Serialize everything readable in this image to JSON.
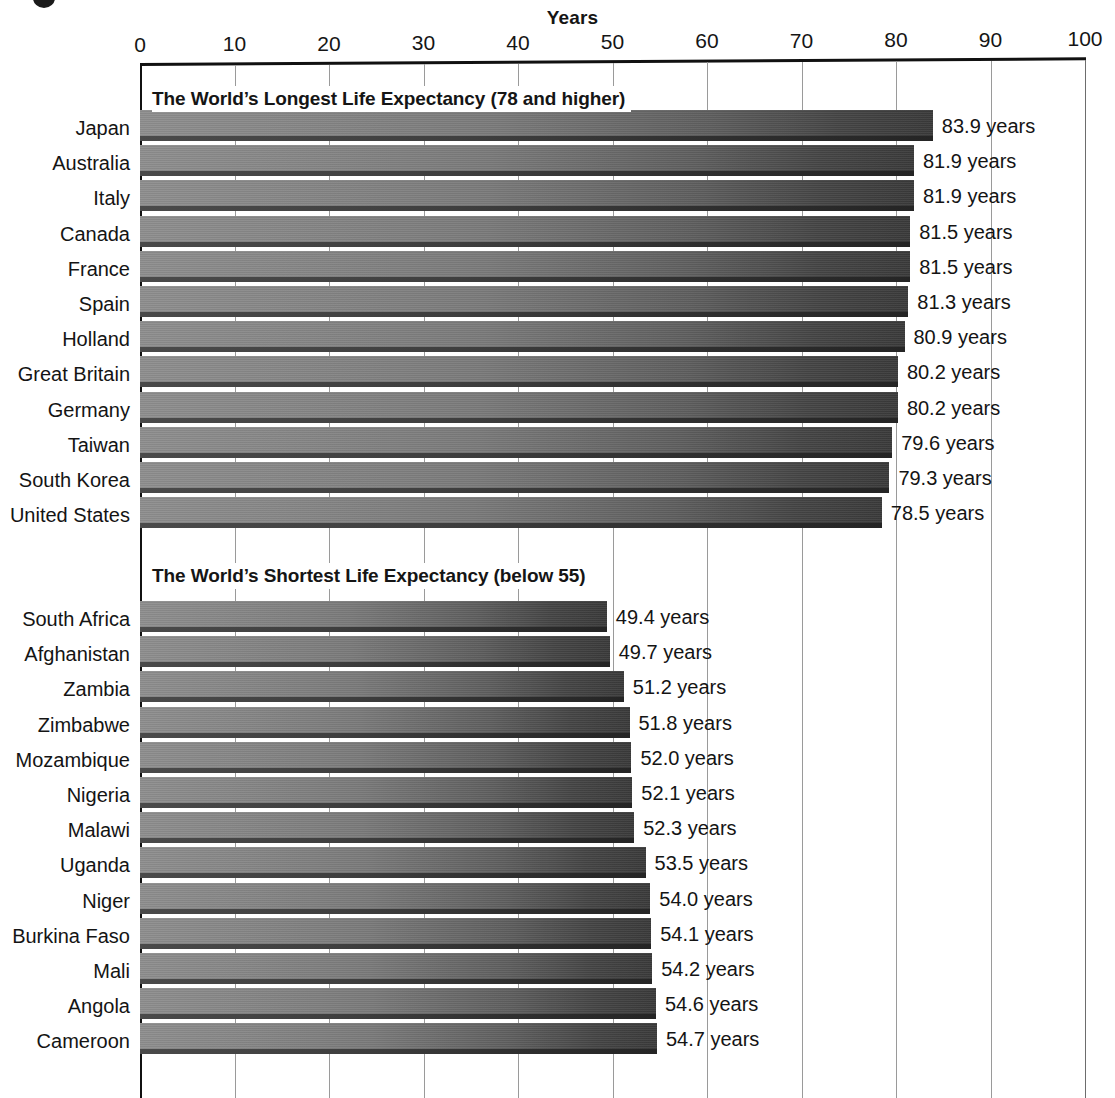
{
  "axis": {
    "title": "Years",
    "ticks": [
      0,
      10,
      20,
      30,
      40,
      50,
      60,
      70,
      80,
      90,
      100
    ],
    "min": 0,
    "max": 100,
    "unit_suffix": "years"
  },
  "sections": [
    {
      "id": "longest",
      "title": "The World’s Longest Life Expectancy (78 and higher)",
      "rows": [
        {
          "label": "Japan",
          "value": 83.9,
          "value_label": "83.9 years"
        },
        {
          "label": "Australia",
          "value": 81.9,
          "value_label": "81.9 years"
        },
        {
          "label": "Italy",
          "value": 81.9,
          "value_label": "81.9 years"
        },
        {
          "label": "Canada",
          "value": 81.5,
          "value_label": "81.5 years"
        },
        {
          "label": "France",
          "value": 81.5,
          "value_label": "81.5 years"
        },
        {
          "label": "Spain",
          "value": 81.3,
          "value_label": "81.3 years"
        },
        {
          "label": "Holland",
          "value": 80.9,
          "value_label": "80.9 years"
        },
        {
          "label": "Great Britain",
          "value": 80.2,
          "value_label": "80.2 years"
        },
        {
          "label": "Germany",
          "value": 80.2,
          "value_label": "80.2 years"
        },
        {
          "label": "Taiwan",
          "value": 79.6,
          "value_label": "79.6 years"
        },
        {
          "label": "South Korea",
          "value": 79.3,
          "value_label": "79.3 years"
        },
        {
          "label": "United States",
          "value": 78.5,
          "value_label": "78.5 years"
        }
      ]
    },
    {
      "id": "shortest",
      "title": "The World’s Shortest Life Expectancy (below 55)",
      "rows": [
        {
          "label": "South Africa",
          "value": 49.4,
          "value_label": "49.4 years"
        },
        {
          "label": "Afghanistan",
          "value": 49.7,
          "value_label": "49.7 years"
        },
        {
          "label": "Zambia",
          "value": 51.2,
          "value_label": "51.2 years"
        },
        {
          "label": "Zimbabwe",
          "value": 51.8,
          "value_label": "51.8 years"
        },
        {
          "label": "Mozambique",
          "value": 52.0,
          "value_label": "52.0 years"
        },
        {
          "label": "Nigeria",
          "value": 52.1,
          "value_label": "52.1 years"
        },
        {
          "label": "Malawi",
          "value": 52.3,
          "value_label": "52.3 years"
        },
        {
          "label": "Uganda",
          "value": 53.5,
          "value_label": "53.5 years"
        },
        {
          "label": "Niger",
          "value": 54.0,
          "value_label": "54.0 years"
        },
        {
          "label": "Burkina Faso",
          "value": 54.1,
          "value_label": "54.1 years"
        },
        {
          "label": "Mali",
          "value": 54.2,
          "value_label": "54.2 years"
        },
        {
          "label": "Angola",
          "value": 54.6,
          "value_label": "54.6 years"
        },
        {
          "label": "Cameroon",
          "value": 54.7,
          "value_label": "54.7 years"
        }
      ]
    }
  ],
  "colors": {
    "bar_light": "#8e8e8e",
    "bar_dark": "#3a3a3a",
    "bar_shadow": "#2e2e2e",
    "axis": "#111111",
    "gridline": "#9a9a9a",
    "text": "#141414",
    "background": "#ffffff"
  },
  "chart_data": {
    "type": "bar",
    "orientation": "horizontal",
    "title": "Years",
    "xlabel": "Years",
    "ylabel": "",
    "xlim": [
      0,
      100
    ],
    "xticks": [
      0,
      10,
      20,
      30,
      40,
      50,
      60,
      70,
      80,
      90,
      100
    ],
    "grid": true,
    "legend": "none",
    "groups": [
      {
        "name": "The World’s Longest Life Expectancy (78 and higher)",
        "categories": [
          "Japan",
          "Australia",
          "Italy",
          "Canada",
          "France",
          "Spain",
          "Holland",
          "Great Britain",
          "Germany",
          "Taiwan",
          "South Korea",
          "United States"
        ],
        "values": [
          83.9,
          81.9,
          81.9,
          81.5,
          81.5,
          81.3,
          80.9,
          80.2,
          80.2,
          79.6,
          79.3,
          78.5
        ],
        "data_labels": [
          "83.9 years",
          "81.9 years",
          "81.9 years",
          "81.5 years",
          "81.5 years",
          "81.3 years",
          "80.9 years",
          "80.2 years",
          "80.2 years",
          "79.6 years",
          "79.3 years",
          "78.5 years"
        ]
      },
      {
        "name": "The World’s Shortest Life Expectancy (below 55)",
        "categories": [
          "South Africa",
          "Afghanistan",
          "Zambia",
          "Zimbabwe",
          "Mozambique",
          "Nigeria",
          "Malawi",
          "Uganda",
          "Niger",
          "Burkina Faso",
          "Mali",
          "Angola",
          "Cameroon"
        ],
        "values": [
          49.4,
          49.7,
          51.2,
          51.8,
          52.0,
          52.1,
          52.3,
          53.5,
          54.0,
          54.1,
          54.2,
          54.6,
          54.7
        ],
        "data_labels": [
          "49.4 years",
          "49.7 years",
          "51.2 years",
          "51.8 years",
          "52.0 years",
          "52.1 years",
          "52.3 years",
          "53.5 years",
          "54.0 years",
          "54.1 years",
          "54.2 years",
          "54.6 years",
          "54.7 years"
        ]
      }
    ]
  }
}
